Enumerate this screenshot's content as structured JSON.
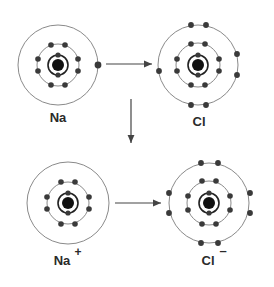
{
  "colors": {
    "ring": "#8a8a8a",
    "inner_ring": "#222222",
    "electron": "#3a3a3a",
    "nucleus": "#111111",
    "arrow": "#444444",
    "label": "#2a2a2a"
  },
  "atoms": [
    {
      "id": "na",
      "label": "Na",
      "superscript": "",
      "cx": 58,
      "cy": 65,
      "shells": [
        2,
        8,
        1
      ]
    },
    {
      "id": "cl",
      "label": "Cl",
      "superscript": "",
      "cx": 198,
      "cy": 65,
      "shells": [
        2,
        8,
        7
      ]
    },
    {
      "id": "na-ion",
      "label": "Na",
      "superscript": "+",
      "cx": 68,
      "cy": 203,
      "shells": [
        2,
        8,
        0
      ]
    },
    {
      "id": "cl-ion",
      "label": "Cl",
      "superscript": "–",
      "cx": 209,
      "cy": 203,
      "shells": [
        2,
        8,
        8
      ]
    }
  ],
  "labels": {
    "na": "Na",
    "cl": "Cl",
    "na_ion": "Na",
    "na_ion_charge": "+",
    "cl_ion": "Cl",
    "cl_ion_charge": "–"
  },
  "arrows": [
    {
      "id": "electron-transfer-arrow",
      "direction": "right"
    },
    {
      "id": "reaction-arrow",
      "direction": "down"
    },
    {
      "id": "ion-transfer-arrow",
      "direction": "right"
    }
  ]
}
